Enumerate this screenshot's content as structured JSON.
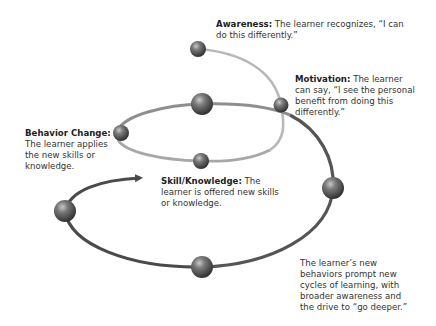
{
  "stages": {
    "awareness": {
      "heading": "Awareness:",
      "text": " The learner recognizes, “I can do this differently.”"
    },
    "motivation": {
      "heading": "Motivation:",
      "text": " The learner can say, “I see the personal benefit from doing this differently.”"
    },
    "behavior_change": {
      "heading": "Behavior Change:",
      "text": " The learner applies the new skills or knowledge."
    },
    "skill_knowledge": {
      "heading": "Skill/Knowledge:",
      "text": " The learner is offered new skills or knowledge."
    },
    "new_cycle": {
      "text": "The learner’s new behaviors prompt new cycles of learning, with broader awareness and the drive to “go deeper.”"
    }
  },
  "colors": {
    "line_light": "#b5b5b5",
    "line_mid": "#8a8a8a",
    "line_dark": "#4a4a4a",
    "ball_dark": "#3a3a3a",
    "ball_light": "#9a9a9a",
    "text": "#333333"
  }
}
